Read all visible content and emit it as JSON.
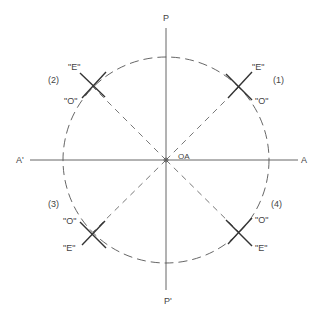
{
  "axes": {
    "top": "P",
    "bottom": "P'",
    "left": "A'",
    "right": "A",
    "origin": "OA"
  },
  "quadrants": [
    {
      "id": "(1)",
      "e_label": "\"E\"",
      "o_label": "\"O\""
    },
    {
      "id": "(2)",
      "e_label": "\"E\"",
      "o_label": "\"O\""
    },
    {
      "id": "(3)",
      "e_label": "\"E\"",
      "o_label": "\"O\""
    },
    {
      "id": "(4)",
      "e_label": "\"E\"",
      "o_label": "\"O\""
    }
  ],
  "colors": {
    "line": "#444444",
    "background": "#ffffff"
  }
}
